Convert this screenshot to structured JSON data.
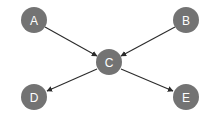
{
  "diagram": {
    "type": "directed-graph",
    "width": 213,
    "height": 120,
    "background_color": "#ffffff",
    "node_fill_color": "#737373",
    "node_label_color": "#ffffff",
    "edge_color": "#2b2b2b",
    "node_radius": 13,
    "nodes": [
      {
        "id": "A",
        "label": "A",
        "cx": 34,
        "cy": 20
      },
      {
        "id": "B",
        "label": "B",
        "cx": 186,
        "cy": 20
      },
      {
        "id": "C",
        "label": "C",
        "cx": 109,
        "cy": 62
      },
      {
        "id": "D",
        "label": "D",
        "cx": 34,
        "cy": 97
      },
      {
        "id": "E",
        "label": "E",
        "cx": 186,
        "cy": 97
      }
    ],
    "edges": [
      {
        "id": "A-C",
        "from": "A",
        "to": "C",
        "directed": true,
        "x1": 45,
        "y1": 27,
        "x2": 97,
        "y2": 56
      },
      {
        "id": "B-C",
        "from": "B",
        "to": "C",
        "directed": true,
        "x1": 175,
        "y1": 27,
        "x2": 121,
        "y2": 56
      },
      {
        "id": "C-D",
        "from": "C",
        "to": "D",
        "directed": true,
        "x1": 97,
        "y1": 69,
        "x2": 47,
        "y2": 91
      },
      {
        "id": "C-E",
        "from": "C",
        "to": "E",
        "directed": true,
        "x1": 121,
        "y1": 69,
        "x2": 173,
        "y2": 91
      }
    ]
  }
}
